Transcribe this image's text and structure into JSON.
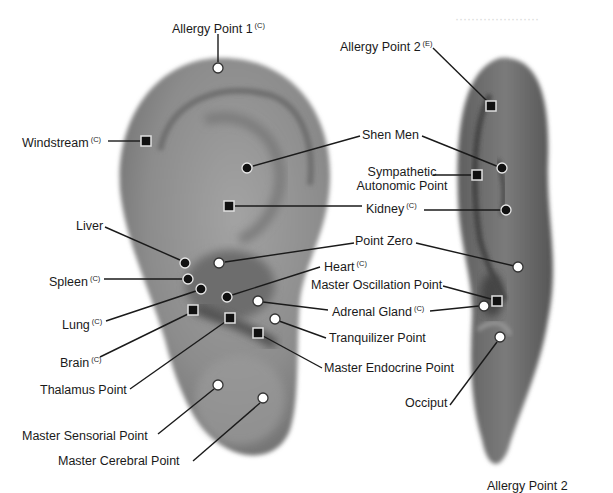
{
  "diagram": {
    "legend_notes": {
      "C": "(C)",
      "E": "(E)"
    },
    "colors": {
      "ear_fill": "#8a8a8a",
      "ear_dark": "#5a5a5a",
      "marker_black": "#111111",
      "marker_white": "#ffffff",
      "line": "#1a1a1a"
    },
    "labels": [
      {
        "id": "allergy-point-1",
        "text": "Allergy Point 1",
        "sup": "(C)",
        "x": 172,
        "y": 19,
        "align": "left",
        "marker": {
          "type": "circle-white",
          "x": 218,
          "y": 68
        },
        "line": [
          [
            218,
            34
          ],
          [
            218,
            62
          ]
        ]
      },
      {
        "id": "windstream",
        "text": "Windstream",
        "sup": "(C)",
        "x": 22,
        "y": 133,
        "align": "left",
        "marker": {
          "type": "square-black",
          "x": 146,
          "y": 141
        },
        "line": [
          [
            108,
            141
          ],
          [
            140,
            141
          ]
        ]
      },
      {
        "id": "allergy-point-2",
        "text": "Allergy Point 2",
        "sup": "(E)",
        "x": 340,
        "y": 37,
        "align": "left",
        "marker": {
          "type": "square-black",
          "x": 491,
          "y": 106
        },
        "line": [
          [
            433,
            48
          ],
          [
            487,
            101
          ]
        ]
      },
      {
        "id": "shen-men",
        "text": "Shen Men",
        "sup": "",
        "x": 362,
        "y": 128,
        "align": "left",
        "marker": {
          "type": "circle-black",
          "x": 247,
          "y": 168
        },
        "line": [
          [
            360,
            136
          ],
          [
            253,
            166
          ]
        ],
        "line2": [
          [
            422,
            136
          ],
          [
            499,
            167
          ]
        ],
        "marker2": {
          "type": "circle-black",
          "x": 502,
          "y": 168
        }
      },
      {
        "id": "sympathetic-autonomic-point",
        "text": "Sympathetic",
        "text2": "Autonomic Point",
        "sup": "",
        "x": 338,
        "y": 165,
        "align": "center",
        "w": 128,
        "marker": {
          "type": "square-black",
          "x": 477,
          "y": 175
        },
        "line": [
          [
            433,
            175
          ],
          [
            471,
            175
          ]
        ]
      },
      {
        "id": "kidney",
        "text": "Kidney",
        "sup": "(C)",
        "x": 366,
        "y": 199,
        "align": "left",
        "marker": {
          "type": "square-black",
          "x": 229,
          "y": 206
        },
        "line": [
          [
            235,
            206
          ],
          [
            362,
            206
          ]
        ],
        "line2": [
          [
            424,
            210
          ],
          [
            502,
            210
          ]
        ],
        "marker2": {
          "type": "circle-black",
          "x": 506,
          "y": 210
        }
      },
      {
        "id": "point-zero",
        "text": "Point Zero",
        "sup": "",
        "x": 355,
        "y": 234,
        "align": "left",
        "marker": {
          "type": "circle-white",
          "x": 219,
          "y": 263
        },
        "line": [
          [
            354,
            243
          ],
          [
            225,
            262
          ]
        ],
        "line2": [
          [
            416,
            243
          ],
          [
            514,
            266
          ]
        ],
        "marker2": {
          "type": "circle-white",
          "x": 518,
          "y": 267
        }
      },
      {
        "id": "liver",
        "text": "Liver",
        "sup": "",
        "x": 76,
        "y": 219,
        "align": "left",
        "marker": {
          "type": "circle-black",
          "x": 185,
          "y": 263
        },
        "line": [
          [
            105,
            227
          ],
          [
            180,
            260
          ]
        ]
      },
      {
        "id": "heart",
        "text": "Heart",
        "sup": "(C)",
        "x": 324,
        "y": 257,
        "align": "left",
        "marker": {
          "type": "circle-black",
          "x": 227,
          "y": 297
        },
        "line": [
          [
            320,
            267
          ],
          [
            232,
            295
          ]
        ]
      },
      {
        "id": "spleen",
        "text": "Spleen",
        "sup": "(C)",
        "x": 49,
        "y": 272,
        "align": "left",
        "marker": {
          "type": "circle-black",
          "x": 188,
          "y": 279
        },
        "line": [
          [
            104,
            279
          ],
          [
            182,
            279
          ]
        ]
      },
      {
        "id": "master-oscillation-point",
        "text": "Master Oscillation Point",
        "sup": "",
        "x": 311,
        "y": 278,
        "align": "left",
        "marker": {
          "type": "square-black",
          "x": 497,
          "y": 301
        },
        "line": [
          [
            443,
            286
          ],
          [
            491,
            299
          ]
        ]
      },
      {
        "id": "lung",
        "text": "Lung",
        "sup": "(C)",
        "x": 62,
        "y": 315,
        "align": "left",
        "marker": {
          "type": "circle-black",
          "x": 201,
          "y": 289
        },
        "line": [
          [
            106,
            321
          ],
          [
            196,
            291
          ]
        ]
      },
      {
        "id": "adrenal-gland",
        "text": "Adrenal Gland",
        "sup": "(C)",
        "x": 332,
        "y": 302,
        "align": "left",
        "marker": {
          "type": "circle-white",
          "x": 258,
          "y": 301
        },
        "line": [
          [
            328,
            310
          ],
          [
            263,
            302
          ]
        ],
        "line2": [
          [
            430,
            311
          ],
          [
            479,
            306
          ]
        ],
        "marker2": {
          "type": "circle-white",
          "x": 484,
          "y": 306
        }
      },
      {
        "id": "tranquilizer-point",
        "text": "Tranquilizer Point",
        "sup": "",
        "x": 329,
        "y": 331,
        "align": "left",
        "marker": {
          "type": "circle-white",
          "x": 275,
          "y": 319
        },
        "line": [
          [
            326,
            338
          ],
          [
            279,
            321
          ]
        ]
      },
      {
        "id": "brain",
        "text": "Brain",
        "sup": "(C)",
        "x": 60,
        "y": 353,
        "align": "left",
        "marker": {
          "type": "square-black",
          "x": 193,
          "y": 310
        },
        "line": [
          [
            100,
            357
          ],
          [
            188,
            314
          ]
        ]
      },
      {
        "id": "master-endocrine-point",
        "text": "Master Endocrine Point",
        "sup": "",
        "x": 324,
        "y": 361,
        "align": "left",
        "marker": {
          "type": "square-black",
          "x": 258,
          "y": 333
        },
        "line": [
          [
            322,
            368
          ],
          [
            263,
            336
          ]
        ],
        "extra_marker": {
          "type": "square-black",
          "x": 230,
          "y": 318
        }
      },
      {
        "id": "thalamus-point",
        "text": "Thalamus Point",
        "sup": "",
        "x": 40,
        "y": 383,
        "align": "left",
        "marker": {
          "type": "square-black",
          "x": 230,
          "y": 318
        },
        "line": [
          [
            130,
            389
          ],
          [
            225,
            322
          ]
        ]
      },
      {
        "id": "occiput",
        "text": "Occiput",
        "sup": "",
        "x": 405,
        "y": 396,
        "align": "left",
        "marker": {
          "type": "circle-white",
          "x": 500,
          "y": 337
        },
        "line": [
          [
            450,
            405
          ],
          [
            497,
            342
          ]
        ]
      },
      {
        "id": "master-sensorial-point",
        "text": "Master Sensorial Point",
        "sup": "",
        "x": 22,
        "y": 429,
        "align": "left",
        "marker": {
          "type": "circle-white",
          "x": 218,
          "y": 385
        },
        "line": [
          [
            158,
            434
          ],
          [
            214,
            389
          ]
        ]
      },
      {
        "id": "master-cerebral-point",
        "text": "Master Cerebral Point",
        "sup": "",
        "x": 58,
        "y": 454,
        "align": "left",
        "marker": {
          "type": "circle-white",
          "x": 263,
          "y": 398
        },
        "line": [
          [
            193,
            461
          ],
          [
            260,
            403
          ]
        ]
      }
    ],
    "cutoff_text": {
      "text": "Allergy Point 2",
      "x": 487,
      "y": 480
    }
  }
}
